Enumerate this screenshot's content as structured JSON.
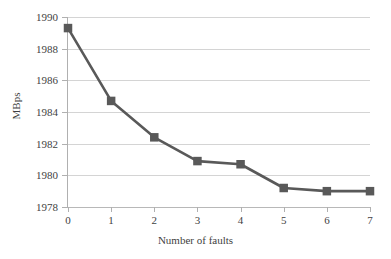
{
  "chart_data": {
    "type": "line",
    "title": "",
    "xlabel": "Number of faults",
    "ylabel": "MBps",
    "x": [
      0,
      1,
      2,
      3,
      4,
      5,
      6,
      7
    ],
    "values": [
      1989.3,
      1984.7,
      1982.4,
      1980.9,
      1980.7,
      1979.2,
      1979.0,
      1979.0
    ],
    "series": [
      {
        "name": "MBps",
        "values": [
          1989.3,
          1984.7,
          1982.4,
          1980.9,
          1980.7,
          1979.2,
          1979.0,
          1979.0
        ]
      }
    ],
    "xlim": [
      0,
      7
    ],
    "ylim": [
      1978,
      1990
    ],
    "ytick_labels": [
      "1990",
      "1988",
      "1986",
      "1984",
      "1982",
      "1980",
      "1978"
    ],
    "ytick_values": [
      1990,
      1988,
      1986,
      1984,
      1982,
      1980,
      1978
    ],
    "xtick_labels": [
      "0",
      "1",
      "2",
      "3",
      "4",
      "5",
      "6",
      "7"
    ],
    "xtick_values": [
      0,
      1,
      2,
      3,
      4,
      5,
      6,
      7
    ],
    "grid": "horizontal",
    "legend": "none",
    "marker": "square",
    "line_color": "#595959",
    "marker_color": "#595959",
    "grid_color": "#d4d4d4",
    "background_color": "#ffffff"
  }
}
